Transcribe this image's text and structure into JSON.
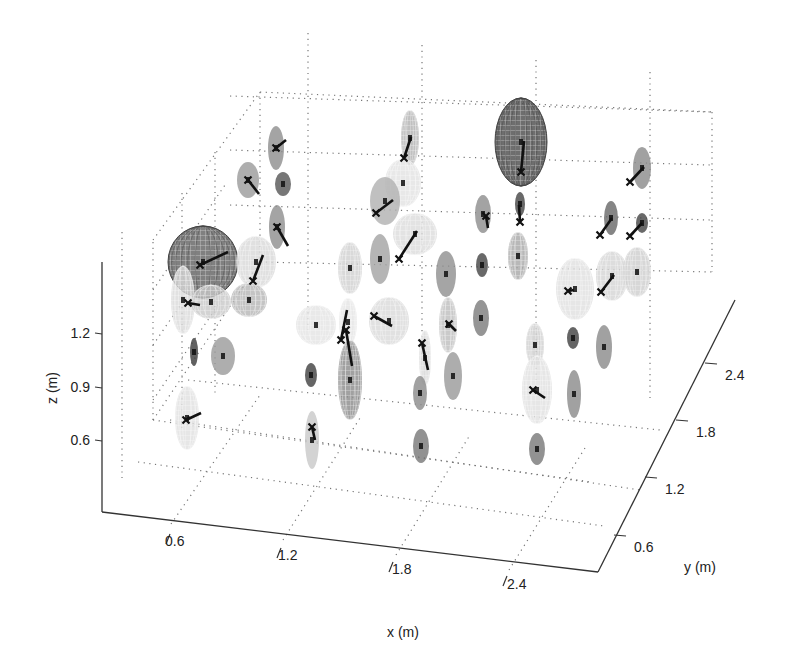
{
  "chart_data": {
    "type": "scatter3d",
    "title": "",
    "xlabel": "x (m)",
    "ylabel": "y (m)",
    "zlabel": "z (m)",
    "x_ticks": [
      "0.6",
      "1.2",
      "1.8",
      "2.4"
    ],
    "y_ticks": [
      "0.6",
      "1.2",
      "1.8",
      "2.4"
    ],
    "z_ticks": [
      "0.6",
      "0.9",
      "1.2"
    ],
    "xlim": [
      0.2,
      2.9
    ],
    "ylim": [
      0.3,
      2.8
    ],
    "zlim": [
      0.3,
      1.5
    ],
    "grid": true,
    "legend": null,
    "ellipsoids": [
      {
        "cx": 203,
        "cy": 262,
        "rx": 35,
        "ry": 36,
        "shade": "#6a6a6a",
        "wire": true,
        "large": true
      },
      {
        "cx": 521,
        "cy": 142,
        "rx": 26,
        "ry": 44,
        "shade": "#555555",
        "wire": true,
        "large": true
      },
      {
        "cx": 256,
        "cy": 262,
        "rx": 20,
        "ry": 26,
        "shade": "#d8d8d8",
        "wire": true
      },
      {
        "cx": 183,
        "cy": 300,
        "rx": 12,
        "ry": 34,
        "shade": "#d9d9d9",
        "wire": true
      },
      {
        "cx": 211,
        "cy": 302,
        "rx": 20,
        "ry": 17,
        "shade": "#c8c8c8",
        "wire": true
      },
      {
        "cx": 249,
        "cy": 300,
        "rx": 18,
        "ry": 17,
        "shade": "#b5b5b5",
        "wire": true
      },
      {
        "cx": 276,
        "cy": 148,
        "rx": 8,
        "ry": 22,
        "shade": "#8d8d8d"
      },
      {
        "cx": 248,
        "cy": 180,
        "rx": 11,
        "ry": 18,
        "shade": "#9a9a9a"
      },
      {
        "cx": 283,
        "cy": 184,
        "rx": 8,
        "ry": 12,
        "shade": "#555555"
      },
      {
        "cx": 277,
        "cy": 227,
        "rx": 8,
        "ry": 22,
        "shade": "#8d8d8d"
      },
      {
        "cx": 410,
        "cy": 138,
        "rx": 9,
        "ry": 28,
        "shade": "#b0b0b0",
        "wire": true
      },
      {
        "cx": 403,
        "cy": 183,
        "rx": 18,
        "ry": 24,
        "shade": "#e2e2e2",
        "wire": true
      },
      {
        "cx": 385,
        "cy": 201,
        "rx": 15,
        "ry": 24,
        "shade": "#b0b0b0"
      },
      {
        "cx": 415,
        "cy": 234,
        "rx": 22,
        "ry": 21,
        "shade": "#dcdcdc",
        "wire": true
      },
      {
        "cx": 350,
        "cy": 268,
        "rx": 12,
        "ry": 26,
        "shade": "#cfcfcf",
        "wire": true
      },
      {
        "cx": 380,
        "cy": 259,
        "rx": 10,
        "ry": 25,
        "shade": "#a2a2a2"
      },
      {
        "cx": 316,
        "cy": 325,
        "rx": 20,
        "ry": 20,
        "shade": "#e3e3e3",
        "wire": true
      },
      {
        "cx": 389,
        "cy": 321,
        "rx": 20,
        "ry": 24,
        "shade": "#d9d9d9",
        "wire": true
      },
      {
        "cx": 348,
        "cy": 322,
        "rx": 9,
        "ry": 24,
        "shade": "#e3e3e3",
        "wire": true
      },
      {
        "cx": 350,
        "cy": 380,
        "rx": 12,
        "ry": 40,
        "shade": "#8a8a8a",
        "wire": true
      },
      {
        "cx": 194,
        "cy": 352,
        "rx": 4,
        "ry": 14,
        "shade": "#3a3a3a"
      },
      {
        "cx": 223,
        "cy": 356,
        "rx": 12,
        "ry": 19,
        "shade": "#9a9a9a"
      },
      {
        "cx": 187,
        "cy": 418,
        "rx": 12,
        "ry": 32,
        "shade": "#e0e0e0",
        "wire": true
      },
      {
        "cx": 311,
        "cy": 375,
        "rx": 6,
        "ry": 12,
        "shade": "#3e3e3e"
      },
      {
        "cx": 312,
        "cy": 440,
        "rx": 7,
        "ry": 29,
        "shade": "#c8c8c8"
      },
      {
        "cx": 446,
        "cy": 274,
        "rx": 10,
        "ry": 23,
        "shade": "#8f8f8f"
      },
      {
        "cx": 482,
        "cy": 265,
        "rx": 6,
        "ry": 12,
        "shade": "#444444"
      },
      {
        "cx": 448,
        "cy": 325,
        "rx": 9,
        "ry": 28,
        "shade": "#bdbdbd",
        "wire": true
      },
      {
        "cx": 481,
        "cy": 318,
        "rx": 8,
        "ry": 18,
        "shade": "#7a7a7a"
      },
      {
        "cx": 425,
        "cy": 358,
        "rx": 6,
        "ry": 28,
        "shade": "#d5d5d5",
        "wire": true
      },
      {
        "cx": 420,
        "cy": 393,
        "rx": 7,
        "ry": 17,
        "shade": "#8a8a8a"
      },
      {
        "cx": 453,
        "cy": 376,
        "rx": 9,
        "ry": 24,
        "shade": "#999999"
      },
      {
        "cx": 421,
        "cy": 446,
        "rx": 8,
        "ry": 17,
        "shade": "#777777"
      },
      {
        "cx": 483,
        "cy": 214,
        "rx": 8,
        "ry": 19,
        "shade": "#8c8c8c"
      },
      {
        "cx": 518,
        "cy": 256,
        "rx": 10,
        "ry": 24,
        "shade": "#a6a6a6",
        "wire": true
      },
      {
        "cx": 520,
        "cy": 204,
        "rx": 5,
        "ry": 12,
        "shade": "#444444"
      },
      {
        "cx": 575,
        "cy": 289,
        "rx": 19,
        "ry": 31,
        "shade": "#e0e0e0",
        "wire": true
      },
      {
        "cx": 612,
        "cy": 276,
        "rx": 16,
        "ry": 25,
        "shade": "#d5d5d5",
        "wire": true
      },
      {
        "cx": 637,
        "cy": 272,
        "rx": 14,
        "ry": 25,
        "shade": "#cdcdcd",
        "wire": true
      },
      {
        "cx": 611,
        "cy": 218,
        "rx": 7,
        "ry": 17,
        "shade": "#666666"
      },
      {
        "cx": 642,
        "cy": 223,
        "rx": 6,
        "ry": 10,
        "shade": "#444444"
      },
      {
        "cx": 642,
        "cy": 168,
        "rx": 9,
        "ry": 21,
        "shade": "#8a8a8a"
      },
      {
        "cx": 535,
        "cy": 345,
        "rx": 9,
        "ry": 22,
        "shade": "#cccccc",
        "wire": true
      },
      {
        "cx": 573,
        "cy": 338,
        "rx": 6,
        "ry": 11,
        "shade": "#3e3e3e"
      },
      {
        "cx": 604,
        "cy": 347,
        "rx": 8,
        "ry": 22,
        "shade": "#8a8a8a"
      },
      {
        "cx": 537,
        "cy": 390,
        "rx": 15,
        "ry": 34,
        "shade": "#e0e0e0",
        "wire": true
      },
      {
        "cx": 574,
        "cy": 394,
        "rx": 7,
        "ry": 24,
        "shade": "#8a8a8a"
      },
      {
        "cx": 537,
        "cy": 449,
        "rx": 8,
        "ry": 16,
        "shade": "#777777"
      }
    ],
    "trajectories": [
      {
        "x1": 200,
        "y1": 265,
        "x2": 228,
        "y2": 252
      },
      {
        "x1": 521,
        "y1": 172,
        "x2": 524,
        "y2": 141
      },
      {
        "x1": 520,
        "y1": 222,
        "x2": 519,
        "y2": 205
      },
      {
        "x1": 376,
        "y1": 213,
        "x2": 393,
        "y2": 200
      },
      {
        "x1": 399,
        "y1": 259,
        "x2": 417,
        "y2": 231
      },
      {
        "x1": 374,
        "y1": 316,
        "x2": 392,
        "y2": 326
      },
      {
        "x1": 253,
        "y1": 281,
        "x2": 263,
        "y2": 255
      },
      {
        "x1": 404,
        "y1": 158,
        "x2": 411,
        "y2": 137
      },
      {
        "x1": 248,
        "y1": 180,
        "x2": 259,
        "y2": 194
      },
      {
        "x1": 276,
        "y1": 148,
        "x2": 286,
        "y2": 140
      },
      {
        "x1": 277,
        "y1": 227,
        "x2": 288,
        "y2": 246
      },
      {
        "x1": 600,
        "y1": 235,
        "x2": 612,
        "y2": 218
      },
      {
        "x1": 630,
        "y1": 236,
        "x2": 642,
        "y2": 223
      },
      {
        "x1": 630,
        "y1": 182,
        "x2": 644,
        "y2": 167
      },
      {
        "x1": 601,
        "y1": 292,
        "x2": 614,
        "y2": 275
      },
      {
        "x1": 568,
        "y1": 291,
        "x2": 574,
        "y2": 290
      },
      {
        "x1": 341,
        "y1": 340,
        "x2": 347,
        "y2": 310
      },
      {
        "x1": 346,
        "y1": 330,
        "x2": 352,
        "y2": 366
      },
      {
        "x1": 186,
        "y1": 420,
        "x2": 201,
        "y2": 413
      },
      {
        "x1": 312,
        "y1": 427,
        "x2": 315,
        "y2": 440
      },
      {
        "x1": 422,
        "y1": 343,
        "x2": 428,
        "y2": 370
      },
      {
        "x1": 533,
        "y1": 390,
        "x2": 545,
        "y2": 398
      },
      {
        "x1": 486,
        "y1": 216,
        "x2": 488,
        "y2": 228
      },
      {
        "x1": 449,
        "y1": 324,
        "x2": 456,
        "y2": 331
      },
      {
        "x1": 188,
        "y1": 303,
        "x2": 200,
        "y2": 305
      }
    ]
  },
  "axes": {
    "x_label": "x (m)",
    "y_label": "y (m)",
    "z_label": "z (m)",
    "x_ticks": [
      {
        "label": "0.6",
        "x": 165,
        "y": 546,
        "tx": 178,
        "ty": 524
      },
      {
        "label": "1.2",
        "x": 276,
        "y": 560,
        "tx": 291,
        "ty": 538
      },
      {
        "label": "1.8",
        "x": 388,
        "y": 574,
        "tx": 405,
        "ty": 552
      },
      {
        "label": "2.4",
        "x": 502,
        "y": 588,
        "tx": 520,
        "ty": 567
      }
    ],
    "y_ticks": [
      {
        "label": "0.6",
        "x": 636,
        "y": 555,
        "tx": 620,
        "ty": 535
      },
      {
        "label": "1.2",
        "x": 667,
        "y": 497,
        "tx": 650,
        "ty": 480
      },
      {
        "label": "1.8",
        "x": 698,
        "y": 440,
        "tx": 680,
        "ty": 425
      },
      {
        "label": "2.4",
        "x": 727,
        "y": 383,
        "tx": 710,
        "ty": 370
      }
    ],
    "z_ticks": [
      {
        "label": "1.2",
        "x": 86,
        "y": 336,
        "tx": 103,
        "ty": 332
      },
      {
        "label": "0.9",
        "x": 86,
        "y": 390,
        "tx": 103,
        "ty": 387
      },
      {
        "label": "0.6",
        "x": 86,
        "y": 443,
        "tx": 103,
        "ty": 440
      }
    ]
  }
}
